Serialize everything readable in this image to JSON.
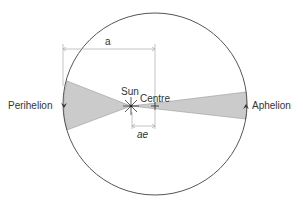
{
  "diagram": {
    "labels": {
      "perihelion": "Perihelion",
      "aphelion": "Aphelion",
      "sun": "Sun",
      "centre": "Centre",
      "semi_major_axis": "a",
      "focal_offset": "ae"
    },
    "colors": {
      "outline": "#555555",
      "wedge_fill": "#cbcbcb",
      "wedge_stroke": "#9a9a9a",
      "dimension_line": "#aaaaaa",
      "text": "#333333",
      "background": "#ffffff"
    },
    "geometry": {
      "orbit_center": [
        155,
        104
      ],
      "orbit_rx": 92,
      "orbit_ry": 91,
      "sun_position": [
        131,
        106
      ],
      "centre_position": [
        155,
        106
      ]
    }
  }
}
